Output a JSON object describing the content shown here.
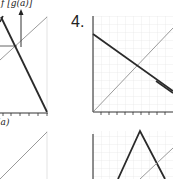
{
  "figure": {
    "problem_number": "4.",
    "left_panel": {
      "top_label": "f [g(a)]",
      "axis_label": "(a)"
    },
    "right_panel": {
      "description": "Grid graphs with a decreasing line and identity diagonal (top), and a tent/triangle function with identity diagonal (bottom)"
    }
  },
  "colors": {
    "dark_line": "#2a2a2a",
    "gray_line": "#9a9a9a",
    "grid": "#e2e2e2",
    "background": "#ffffff"
  }
}
